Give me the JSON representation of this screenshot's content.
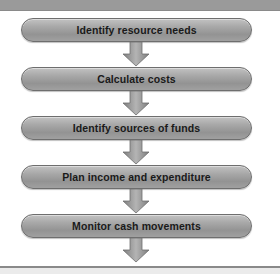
{
  "header": {
    "color": "#9a9a9a"
  },
  "flowchart": {
    "steps": [
      {
        "label": "Identify resource needs"
      },
      {
        "label": "Calculate costs"
      },
      {
        "label": "Identify sources of funds"
      },
      {
        "label": "Plan income and expenditure"
      },
      {
        "label": "Monitor cash movements"
      }
    ],
    "colors": {
      "box_top": "#c2c2c2",
      "box_bottom": "#939393",
      "box_border": "#6e6e6e",
      "text": "#1a1a1a",
      "arrow_fill": "#9a9a9a",
      "arrow_border": "#6e6e6e"
    }
  },
  "footer": {
    "line_color": "#8a8a8a",
    "band_color": "#ebebeb"
  }
}
